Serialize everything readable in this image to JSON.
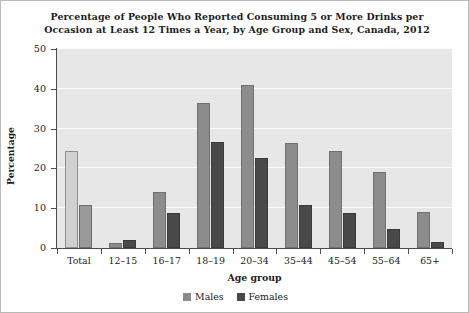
{
  "chart_data": {
    "type": "bar",
    "title": "Percentage of People Who Reported Consuming 5 or More Drinks per Occasion at Least 12 Times a Year, by Age Group and Sex, Canada, 2012",
    "title_lines": [
      "Percentage of People Who Reported Consuming 5 or More Drinks per",
      "Occasion at Least 12 Times a Year, by Age Group and Sex, Canada, 2012"
    ],
    "xlabel": "Age group",
    "ylabel": "Percentage",
    "ylim": [
      0,
      50
    ],
    "yticks": [
      0,
      10,
      20,
      30,
      40,
      50
    ],
    "ytick_labels": [
      "0",
      "10",
      "20",
      "30",
      "40",
      "50"
    ],
    "grid": "horizontal",
    "legend_position": "bottom-center",
    "categories": [
      "Total",
      "12–15",
      "16–17",
      "18–19",
      "20–34",
      "35–44",
      "45–54",
      "55–64",
      "65+"
    ],
    "series": [
      {
        "name": "Males",
        "color": "#8c8c8c",
        "total_color": "#d0d0d0",
        "values": [
          24.5,
          1.3,
          14.0,
          36.5,
          41.0,
          26.4,
          24.3,
          19.0,
          9.0
        ]
      },
      {
        "name": "Females",
        "color": "#494949",
        "total_color": "#9a9a9a",
        "values": [
          10.8,
          2.0,
          8.7,
          26.6,
          22.7,
          10.8,
          8.7,
          4.8,
          1.5
        ]
      }
    ],
    "colors": {
      "plot_background": "#e7e7e7",
      "gridline": "#fdfdfd",
      "axis": "#4d4d4d",
      "text": "#222222",
      "figure_background": "#ffffff",
      "figure_border": "#b9b9b9"
    }
  },
  "legend": {
    "items": [
      {
        "label": "Males",
        "color": "#8c8c8c"
      },
      {
        "label": "Females",
        "color": "#494949"
      }
    ]
  }
}
